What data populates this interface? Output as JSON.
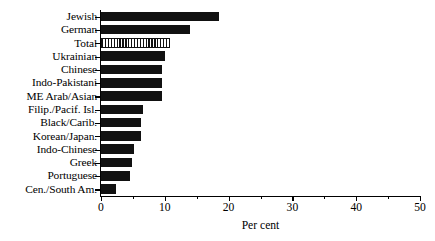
{
  "chart_data": {
    "type": "bar",
    "orientation": "horizontal",
    "title": "",
    "xlabel": "Per cent",
    "ylabel": "",
    "xlim": [
      0,
      50
    ],
    "xticks": [
      0,
      10,
      20,
      30,
      40,
      50
    ],
    "xtick_labels": [
      "0",
      "10",
      "20",
      "30",
      "40",
      "50"
    ],
    "minor_xticks": [
      5,
      15,
      25,
      35,
      45
    ],
    "grid": false,
    "legend": false,
    "categories": [
      "Jewish",
      "German",
      "Total",
      "Ukrainian",
      "Chinese",
      "Indo-Pakistani",
      "ME Arab/Asian",
      "Filip./Pacif. Isl.",
      "Black/Carib.",
      "Korean/Japan.",
      "Indo-Chinese",
      "Greek",
      "Portuguese",
      "Cen./South Am."
    ],
    "values": [
      18.5,
      13.9,
      10.8,
      10.0,
      9.6,
      9.6,
      9.6,
      6.6,
      6.2,
      6.2,
      5.2,
      4.8,
      4.6,
      2.3
    ],
    "bar_styles": [
      "solid",
      "solid",
      "hatched",
      "solid",
      "solid",
      "solid",
      "solid",
      "solid",
      "solid",
      "solid",
      "solid",
      "solid",
      "solid",
      "solid"
    ],
    "bar_color": "#111111",
    "highlight_category": "Total"
  }
}
